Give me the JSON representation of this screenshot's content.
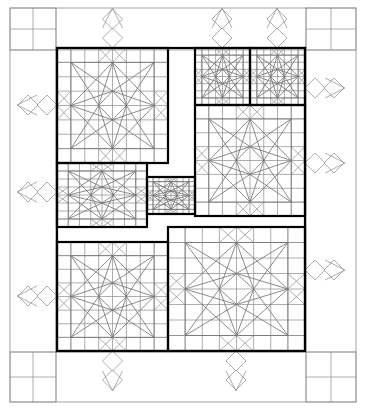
{
  "document": {
    "kind": "quilt-block-layout-diagram",
    "title": "",
    "width": 366,
    "height": 410,
    "background_color": "#ffffff"
  },
  "colors": {
    "background": "#ffffff",
    "thin_line": "#8a8a8a",
    "mid_line": "#6e6e6e",
    "bold_line": "#000000",
    "frame_line": "#9a9a9a"
  },
  "line_weights": {
    "thin": 0.7,
    "mid": 0.8,
    "bold": 2.2,
    "frame": 0.9
  },
  "outer_frame": {
    "label": "outer border",
    "x": 10,
    "y": 8,
    "width": 346,
    "height": 394
  },
  "inner_bold_region": {
    "label": "main pieced field",
    "x": 57,
    "y": 48,
    "width": 248,
    "height": 303
  },
  "grid": {
    "unit": 13.8,
    "block_divisions": 8,
    "show_grid": true
  },
  "motif": {
    "name": "eight-point-star-in-square",
    "description": "square block subdivided 8x8; central diamond/star formed by diagonals from edge midpoints, with corner triangles and flying-geese bands",
    "symmetry": "4-fold rotational"
  },
  "blocks": [
    {
      "id": "block-top-left",
      "name": "large star block top left",
      "x": 57,
      "y": 48,
      "width": 111,
      "height": 115,
      "divisions": 8,
      "border": "bold"
    },
    {
      "id": "block-top-right-a",
      "name": "small star block top right A",
      "x": 195,
      "y": 48,
      "width": 55,
      "height": 57,
      "divisions": 8,
      "border": "bold"
    },
    {
      "id": "block-top-right-b",
      "name": "small star block top right B",
      "x": 250,
      "y": 48,
      "width": 55,
      "height": 57,
      "divisions": 8,
      "border": "bold"
    },
    {
      "id": "block-right-middle",
      "name": "large star block right middle",
      "x": 195,
      "y": 105,
      "width": 110,
      "height": 111,
      "divisions": 8,
      "border": "bold"
    },
    {
      "id": "block-left-middle",
      "name": "medium star block left middle",
      "x": 57,
      "y": 163,
      "width": 90,
      "height": 64,
      "divisions": 8,
      "border": "bold"
    },
    {
      "id": "block-center-small",
      "name": "small star block center",
      "x": 147,
      "y": 177,
      "width": 48,
      "height": 37,
      "divisions": 8,
      "border": "bold"
    },
    {
      "id": "block-bottom-left",
      "name": "large star block bottom left",
      "x": 57,
      "y": 242,
      "width": 111,
      "height": 109,
      "divisions": 8,
      "border": "bold"
    },
    {
      "id": "block-bottom-right",
      "name": "large star block bottom right",
      "x": 168,
      "y": 227,
      "width": 137,
      "height": 124,
      "divisions": 8,
      "border": "bold"
    }
  ],
  "corner_blocks": [
    {
      "id": "corner-top-left",
      "name": "four-patch corner top left",
      "x": 10,
      "y": 8,
      "width": 46,
      "height": 42
    },
    {
      "id": "corner-top-right",
      "name": "four-patch corner top right",
      "x": 306,
      "y": 8,
      "width": 50,
      "height": 42
    },
    {
      "id": "corner-bottom-left",
      "name": "four-patch corner bottom left",
      "x": 10,
      "y": 352,
      "width": 46,
      "height": 50
    },
    {
      "id": "corner-bottom-right",
      "name": "four-patch corner bottom right",
      "x": 306,
      "y": 352,
      "width": 50,
      "height": 50
    }
  ],
  "border_motifs": {
    "name": "diamond chain border",
    "description": "overlapping diamonds extending beyond the bold field into the outer margin on all four sides",
    "top_groups": 3,
    "bottom_groups": 2,
    "left_groups": 3,
    "right_groups": 3
  },
  "legend": {
    "bold_line_meaning": "block outline",
    "thin_line_meaning": "piecing seam line"
  }
}
